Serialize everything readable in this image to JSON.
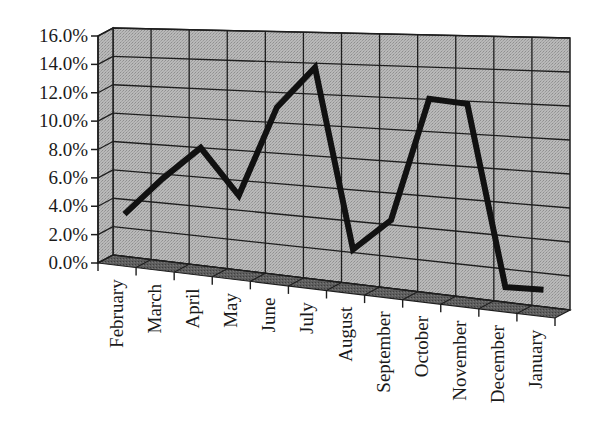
{
  "chart_data": {
    "type": "line",
    "title": "",
    "xlabel": "",
    "ylabel": "",
    "style": "3d",
    "grid": true,
    "legend": "none",
    "categories": [
      "February",
      "March",
      "April",
      "May",
      "June",
      "July",
      "August",
      "September",
      "October",
      "November",
      "December",
      "January"
    ],
    "series": [
      {
        "name": "Series 1",
        "values": [
          3.3,
          6.0,
          8.3,
          5.3,
          11.3,
          14.0,
          2.5,
          4.6,
          12.3,
          12.1,
          1.2,
          1.3
        ]
      }
    ],
    "ylim": [
      0,
      16
    ],
    "yticks": [
      "0.0%",
      "2.0%",
      "4.0%",
      "6.0%",
      "8.0%",
      "10.0%",
      "12.0%",
      "14.0%",
      "16.0%"
    ],
    "colors": {
      "wall": "#b4b4b4",
      "floor": "#5a5a5a",
      "line": "#111111",
      "grid": "#1e1e1e"
    }
  }
}
